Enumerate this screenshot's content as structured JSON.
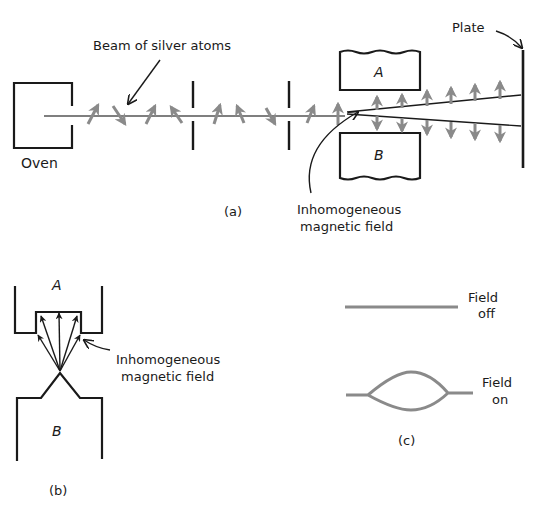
{
  "figure": {
    "panel_a": {
      "caption": "(a)",
      "oven_label": "Oven",
      "beam_label": "Beam of silver atoms",
      "plate_label": "Plate",
      "magnet_top_label": "A",
      "magnet_bottom_label": "B",
      "field_label_line1": "Inhomogeneous",
      "field_label_line2": "magnetic field"
    },
    "panel_b": {
      "caption": "(b)",
      "pole_top_label": "A",
      "pole_bottom_label": "B",
      "field_label_line1": "Inhomogeneous",
      "field_label_line2": "magnetic field"
    },
    "panel_c": {
      "caption": "(c)",
      "field_off_line1": "Field",
      "field_off_line2": "off",
      "field_on_line1": "Field",
      "field_on_line2": "on"
    },
    "colors": {
      "ink": "#1a1a1a",
      "arrow_gray": "#8a8a8a"
    }
  }
}
